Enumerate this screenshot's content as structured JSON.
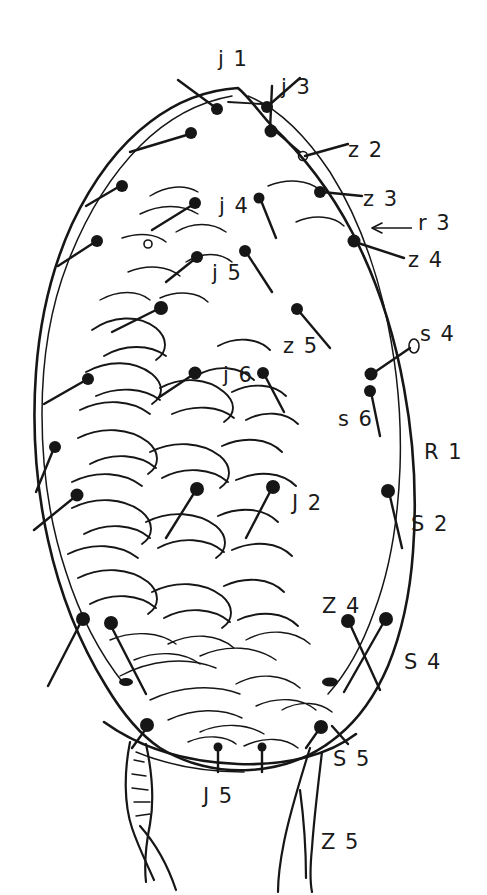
{
  "figure": {
    "kind": "scientific-line-drawing",
    "background_color": "#ffffff",
    "ink_color": "#161616",
    "canvas": {
      "width": 487,
      "height": 895
    }
  },
  "labels": [
    {
      "id": "j1",
      "text": "j 1",
      "x": 218,
      "y": 66,
      "anchor": "start"
    },
    {
      "id": "j3",
      "text": "j 3",
      "x": 281,
      "y": 94,
      "anchor": "start"
    },
    {
      "id": "z2",
      "text": "z 2",
      "x": 348,
      "y": 157,
      "anchor": "start"
    },
    {
      "id": "j4",
      "text": "j 4",
      "x": 219,
      "y": 213,
      "anchor": "start"
    },
    {
      "id": "z3",
      "text": "z 3",
      "x": 363,
      "y": 206,
      "anchor": "start"
    },
    {
      "id": "r3",
      "text": "r 3",
      "x": 418,
      "y": 230,
      "anchor": "start"
    },
    {
      "id": "z4",
      "text": "z 4",
      "x": 408,
      "y": 267,
      "anchor": "start"
    },
    {
      "id": "j5",
      "text": "j 5",
      "x": 212,
      "y": 280,
      "anchor": "start"
    },
    {
      "id": "s4",
      "text": "s 4",
      "x": 420,
      "y": 341,
      "anchor": "start"
    },
    {
      "id": "z5",
      "text": "z 5",
      "x": 283,
      "y": 353,
      "anchor": "start"
    },
    {
      "id": "j6",
      "text": "j 6",
      "x": 223,
      "y": 382,
      "anchor": "start"
    },
    {
      "id": "s6",
      "text": "s 6",
      "x": 338,
      "y": 426,
      "anchor": "start"
    },
    {
      "id": "R1",
      "text": "R 1",
      "x": 424,
      "y": 459,
      "anchor": "start"
    },
    {
      "id": "J2",
      "text": "J 2",
      "x": 292,
      "y": 510,
      "anchor": "start"
    },
    {
      "id": "S2",
      "text": "S 2",
      "x": 411,
      "y": 531,
      "anchor": "start"
    },
    {
      "id": "Z4",
      "text": "Z 4",
      "x": 322,
      "y": 613,
      "anchor": "start"
    },
    {
      "id": "S4",
      "text": "S 4",
      "x": 404,
      "y": 669,
      "anchor": "start"
    },
    {
      "id": "S5",
      "text": "S 5",
      "x": 333,
      "y": 766,
      "anchor": "start"
    },
    {
      "id": "J5",
      "text": "J 5",
      "x": 203,
      "y": 803,
      "anchor": "start"
    },
    {
      "id": "Z5",
      "text": "Z 5",
      "x": 321,
      "y": 849,
      "anchor": "start"
    }
  ]
}
